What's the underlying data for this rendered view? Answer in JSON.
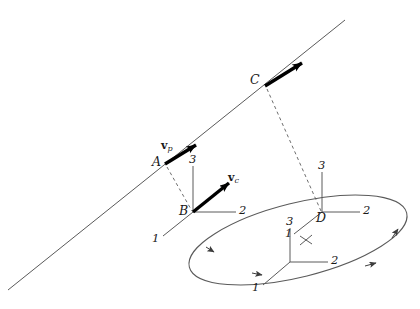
{
  "figure": {
    "kind": "orbital-mechanics-diagram",
    "background_color": "#ffffff",
    "stroke_color": "#4a4a4a",
    "bold_stroke_color": "#000000",
    "text_color": "#1a1a1a",
    "width": 420,
    "height": 309
  },
  "labels": {
    "point_a": "A",
    "point_b": "B",
    "point_c": "C",
    "point_d": "D",
    "velocity_p": "v",
    "velocity_p_sub": "p",
    "velocity_c": "v",
    "velocity_c_sub": "c"
  },
  "frames": [
    {
      "name": "frame-b",
      "origin_label": "B",
      "origin": [
        193,
        212
      ],
      "axis_1": "1",
      "axis_2": "2",
      "axis_3": "3"
    },
    {
      "name": "frame-d",
      "origin_label": "D",
      "origin": [
        322,
        212
      ],
      "axis_1": "1",
      "axis_2": "2",
      "axis_3": "3"
    },
    {
      "name": "frame-orbit-lower",
      "origin_label": "",
      "origin": [
        290,
        262
      ],
      "axis_1": "1",
      "axis_2": "2",
      "axis_3": "3"
    }
  ],
  "axis_labels": {
    "b_1": "1",
    "b_2": "2",
    "b_3": "3",
    "d_1": "1",
    "d_2": "2",
    "d_3": "3",
    "lower_1": "1",
    "lower_2": "2",
    "lower_3": "3"
  },
  "geometry": {
    "straight_line": {
      "from": [
        8,
        290
      ],
      "to": [
        345,
        20
      ],
      "description": "inclined straight trajectory line"
    },
    "thick_segment_a": {
      "from": [
        165,
        163
      ],
      "to": [
        199,
        142
      ],
      "arrow": true
    },
    "thick_segment_c": {
      "from": [
        265,
        85
      ],
      "to": [
        305,
        60
      ],
      "arrow": true
    },
    "vector_c_arrow": {
      "from": [
        193,
        212
      ],
      "to": [
        232,
        180
      ],
      "arrow": true
    },
    "dashed_a_to_b": {
      "from": [
        167,
        166
      ],
      "to": [
        193,
        212
      ]
    },
    "dashed_c_to_d": {
      "from": [
        266,
        88
      ],
      "to": [
        322,
        212
      ]
    },
    "ellipse": {
      "center": [
        298,
        240
      ],
      "rx": 112,
      "ry": 37,
      "rotation_deg": -14,
      "arrow_count": 4
    }
  }
}
